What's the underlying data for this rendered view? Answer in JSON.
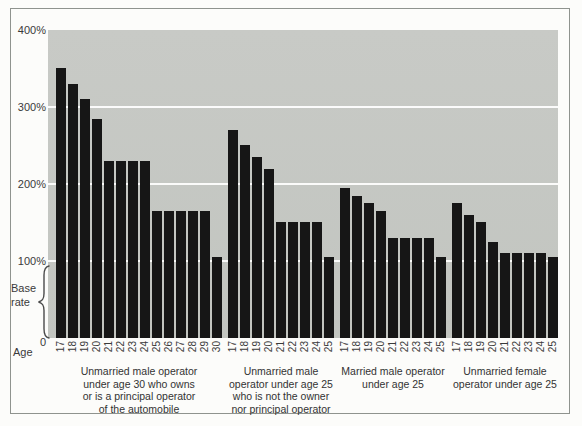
{
  "colors": {
    "page_bg": "#fcfcfa",
    "frame_border": "#8f938e",
    "plot_bg": "#c5c8c3",
    "bar": "#161616",
    "gridline": "#ffffff",
    "text": "#3a3a3a"
  },
  "chart_data": {
    "type": "bar",
    "title": "",
    "x_axis_label": "Age",
    "base_rate_label": [
      "Base",
      "rate"
    ],
    "y_axis": {
      "min": 0,
      "max": 400,
      "unit": "%",
      "ticks": [
        {
          "label": "400%",
          "value": 400
        },
        {
          "label": "300%",
          "value": 300
        },
        {
          "label": "200%",
          "value": 200
        },
        {
          "label": "100%",
          "value": 100
        },
        {
          "label": "0",
          "value": 0
        }
      ],
      "gridlines": [
        300,
        200,
        100
      ],
      "base_rate_brace_range": [
        0,
        100
      ]
    },
    "grid": "on",
    "legend": "none",
    "groups": [
      {
        "caption_lines": [
          "Unmarried male operator",
          "under age 30 who owns",
          "or is a principal operator",
          "of the automobile"
        ],
        "ages": [
          "17",
          "18",
          "19",
          "20",
          "21",
          "22",
          "23",
          "24",
          "25",
          "26",
          "27",
          "28",
          "29",
          "30"
        ],
        "values": [
          350,
          330,
          310,
          285,
          230,
          230,
          230,
          230,
          165,
          165,
          165,
          165,
          165,
          105
        ]
      },
      {
        "caption_lines": [
          "Unmarried male",
          "operator under age 25",
          "who is not the owner",
          "nor principal operator"
        ],
        "ages": [
          "17",
          "18",
          "19",
          "20",
          "21",
          "22",
          "23",
          "24",
          "25"
        ],
        "values": [
          270,
          250,
          235,
          220,
          150,
          150,
          150,
          150,
          105
        ]
      },
      {
        "caption_lines": [
          "Married male operator",
          "under age 25"
        ],
        "ages": [
          "17",
          "18",
          "19",
          "20",
          "21",
          "22",
          "23",
          "24",
          "25"
        ],
        "values": [
          195,
          185,
          175,
          165,
          130,
          130,
          130,
          130,
          105
        ]
      },
      {
        "caption_lines": [
          "Unmarried female",
          "operator under age 25"
        ],
        "ages": [
          "17",
          "18",
          "19",
          "20",
          "21",
          "22",
          "23",
          "24",
          "25"
        ],
        "values": [
          175,
          160,
          150,
          125,
          110,
          110,
          110,
          110,
          105
        ]
      }
    ]
  }
}
